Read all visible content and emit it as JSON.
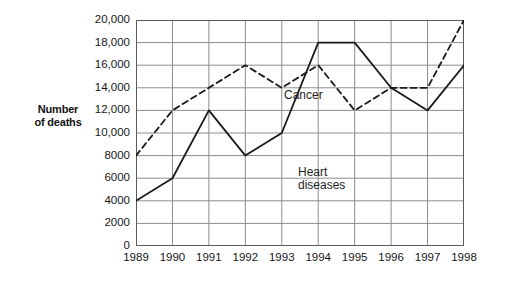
{
  "axis_title": {
    "line1": "Number",
    "line2": "of deaths"
  },
  "chart_data": {
    "type": "line",
    "title": "",
    "xlabel": "",
    "ylabel": "Number of deaths",
    "x": [
      "1989",
      "1990",
      "1991",
      "1992",
      "1993",
      "1994",
      "1995",
      "1996",
      "1997",
      "1998"
    ],
    "categories": [
      "1989",
      "1990",
      "1991",
      "1992",
      "1993",
      "1994",
      "1995",
      "1996",
      "1997",
      "1998"
    ],
    "ylim": [
      0,
      20000
    ],
    "ytick_values": [
      0,
      2000,
      4000,
      6000,
      8000,
      10000,
      12000,
      14000,
      16000,
      18000,
      20000
    ],
    "ytick_labels": [
      "0",
      "2000",
      "4000",
      "6000",
      "8000",
      "10,000",
      "12,000",
      "14,000",
      "16,000",
      "18,000",
      "20,000"
    ],
    "grid": true,
    "legend": "in-plot annotations",
    "series": [
      {
        "name": "Cancer",
        "style": "dashed",
        "color": "#1a1a1a",
        "values": [
          8000,
          12000,
          14000,
          16000,
          14000,
          16000,
          12000,
          14000,
          14000,
          20000
        ]
      },
      {
        "name": "Heart diseases",
        "style": "solid",
        "color": "#1a1a1a",
        "values": [
          4000,
          6000,
          12000,
          8000,
          10000,
          18000,
          18000,
          14000,
          12000,
          16000
        ]
      }
    ],
    "annotations": [
      {
        "text": "Cancer",
        "series": "Cancer"
      },
      {
        "text": "Heart",
        "series": "Heart diseases"
      },
      {
        "text": "diseases",
        "series": "Heart diseases"
      }
    ]
  },
  "colors": {
    "grid": "#8c8c8c",
    "frame": "#5a5a5a",
    "line": "#1a1a1a",
    "text": "#171717",
    "background": "#ffffff"
  }
}
